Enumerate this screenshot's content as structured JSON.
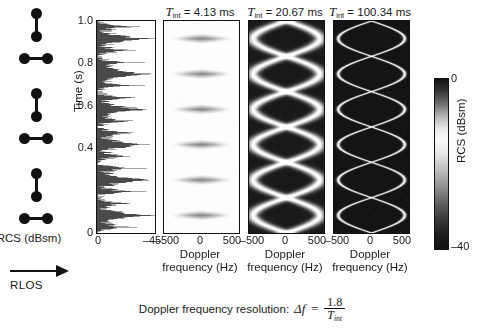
{
  "figure": {
    "caption_equation_prefix": "Doppler frequency resolution:",
    "delta_f_symbol": "Δf",
    "equals": "=",
    "numerator": "1.8",
    "denominator_base": "T",
    "denominator_sub": "int"
  },
  "target_diagram": {
    "name": "rotating-dumbbell-sequence",
    "rlos_label": "RLOS",
    "orientations": [
      "vertical",
      "horizontal",
      "vertical",
      "horizontal",
      "vertical",
      "horizontal"
    ]
  },
  "rcs_plot": {
    "ylabel": "Time (s)",
    "xlabel": "RCS (dBsm)",
    "yticks": [
      "1.0",
      "0.8",
      "0.6",
      "0.4",
      "0"
    ],
    "ytick_values": [
      1.0,
      0.8,
      0.6,
      0.4,
      0.0
    ],
    "xticks": [
      "0",
      "–45"
    ],
    "xtick_values": [
      0,
      -45
    ],
    "xlim": [
      0,
      -45
    ],
    "ylim": [
      0,
      1.0
    ]
  },
  "colorbar": {
    "label": "RCS (dBsm)",
    "tick_top": "0",
    "tick_bottom": "–40",
    "range": [
      -40,
      0
    ]
  },
  "spectrograms": [
    {
      "id": "spec-1",
      "title_symbol": "T",
      "title_sub": "int",
      "title_value": "4.13 ms",
      "t_int_ms": 4.13,
      "xlabel_line1": "Doppler",
      "xlabel_line2": "frequency (Hz)",
      "xticks": [
        "–500",
        "0",
        "500"
      ],
      "xtick_values": [
        -500,
        0,
        500
      ],
      "sharpness": "blurred",
      "band_width_hz": 460
    },
    {
      "id": "spec-2",
      "title_symbol": "T",
      "title_sub": "int",
      "title_value": "20.67 ms",
      "t_int_ms": 20.67,
      "xlabel_line1": "Doppler",
      "xlabel_line2": "frequency (Hz)",
      "xticks": [
        "–500",
        "0",
        "500"
      ],
      "xtick_values": [
        -500,
        0,
        500
      ],
      "sharpness": "medium",
      "band_width_hz": 140
    },
    {
      "id": "spec-3",
      "title_symbol": "T",
      "title_sub": "int",
      "title_value": "100.34 ms",
      "t_int_ms": 100.34,
      "xlabel_line1": "Doppler",
      "xlabel_line2": "frequency (Hz)",
      "xticks": [
        "–500",
        "0",
        "500"
      ],
      "xtick_values": [
        -500,
        0,
        500
      ],
      "sharpness": "sharp",
      "band_width_hz": 50
    }
  ],
  "chart_data": {
    "type": "heatmap",
    "xlabel": "Doppler frequency (Hz)",
    "ylabel": "Time (s)",
    "colorbar_label": "RCS (dBsm)",
    "xlim": [
      -700,
      700
    ],
    "ylim": [
      0,
      1.0
    ],
    "zlim": [
      -40,
      0
    ],
    "grid": false,
    "legend": "none",
    "series": [
      {
        "name": "scatterer-1 Doppler",
        "model": "f(t) = 620 * sin(2*pi*3*t)",
        "amplitude_hz": 620,
        "rotation_rate_hz": 3.0
      },
      {
        "name": "scatterer-2 Doppler",
        "model": "f(t) = -620 * sin(2*pi*3*t)",
        "amplitude_hz": -620,
        "rotation_rate_hz": 3.0
      }
    ],
    "panels": [
      {
        "t_int_ms": 4.13,
        "doppler_resolution_hz": 435.8
      },
      {
        "t_int_ms": 20.67,
        "doppler_resolution_hz": 87.1
      },
      {
        "t_int_ms": 100.34,
        "doppler_resolution_hz": 17.9
      }
    ],
    "rcs_time_series": {
      "type": "line",
      "xlabel": "RCS (dBsm)",
      "ylabel": "Time (s)",
      "xlim": [
        0,
        -45
      ],
      "ylim": [
        0,
        1.0
      ],
      "description": "RCS fluctuation vs time with deep nulls, spiky envelope spanning 0 to -45 dBsm"
    }
  }
}
